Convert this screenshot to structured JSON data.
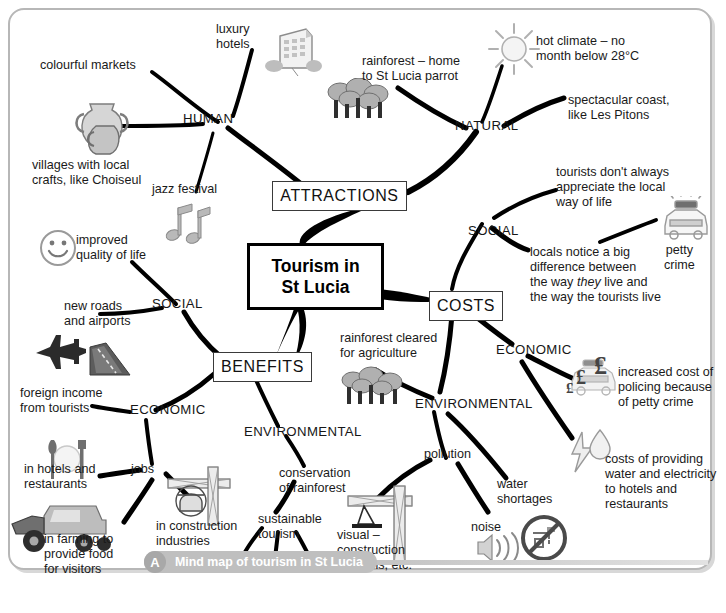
{
  "figure": {
    "caption_badge": "A",
    "caption_text": "Mind map of tourism in St Lucia",
    "center_line1": "Tourism in",
    "center_line2": "St Lucia"
  },
  "branches": {
    "attractions": "ATTRACTIONS",
    "costs": "COSTS",
    "benefits": "BENEFITS"
  },
  "categories": {
    "human": "HUMAN",
    "natural": "NATURAL",
    "social_costs": "SOCIAL",
    "economic_costs": "ECONOMIC",
    "environmental_costs": "ENVIRONMENTAL",
    "social_benefits": "SOCIAL",
    "economic_benefits": "ECONOMIC",
    "environmental_benefits": "ENVIRONMENTAL"
  },
  "leaves": {
    "luxury_hotels": "luxury\nhotels",
    "colourful_markets": "colourful markets",
    "villages_crafts": "villages with local\ncrafts, like Choiseul",
    "jazz_festival": "jazz festival",
    "rainforest_parrot": "rainforest – home\nto St Lucia parrot",
    "hot_climate": "hot climate – no\nmonth below 28°C",
    "spectacular_coast": "spectacular coast,\nlike Les Pitons",
    "tourists_appreciate": "tourists don't always\nappreciate the local\nway of life",
    "petty_crime": "petty\ncrime",
    "locals_notice_pre": "locals notice a big\ndifference between\nthe way ",
    "locals_notice_em": "they",
    "locals_notice_post": " live and\nthe way the tourists live",
    "increased_policing": "increased cost of\npolicing because\nof petty crime",
    "water_electricity": "costs of providing\nwater and electricity\nto hotels and\nrestaurants",
    "rainforest_cleared": "rainforest cleared\nfor agriculture",
    "pollution": "pollution",
    "water_shortages": "water\nshortages",
    "noise": "noise",
    "visual_construction": "visual –\nconstruction\nof hotels, etc.",
    "improved_quality": "improved\nquality of life",
    "new_roads": "new roads\nand airports",
    "foreign_income": "foreign income\nfrom tourists",
    "hotels_restaurants": "in hotels and\nrestaurants",
    "jobs": "jobs",
    "construction_industries": "in construction\nindustries",
    "farming_food": "in farming to\nprovide food\nfor visitors",
    "conservation_rainforest": "conservation\nof rainforest",
    "sustainable_tourism": "sustainable\ntourism",
    "q1": "?",
    "q2": "?",
    "q3": "?"
  },
  "icons": {
    "hotel": "hotel-building-icon",
    "pottery": "pottery-vase-icon",
    "music": "music-notes-icon",
    "trees_natural": "trees-rainforest-icon",
    "sun": "sun-icon",
    "police_car": "police-car-icon",
    "smiley": "smiley-face-icon",
    "plane_road": "airplane-road-icon",
    "cutlery": "cutlery-plate-icon",
    "tractor": "farm-tractor-icon",
    "crane_small": "construction-crane-icon",
    "crane_large": "construction-crane-large-icon",
    "trees_cleared": "trees-cleared-icon",
    "money_police": "pound-police-car-icon",
    "bolt_drop": "lightning-waterdrop-icon",
    "sound_waves": "sound-waves-icon",
    "no_water": "no-water-tap-icon"
  },
  "colors": {
    "frame_border": "#b7b7b7",
    "caption_bar": "#bfbfbf",
    "branch_stroke": "#000000",
    "text": "#1a1a1a",
    "icon_gray": "#9a9a9a"
  }
}
